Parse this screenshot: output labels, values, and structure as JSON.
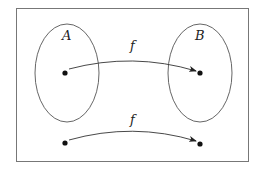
{
  "diagram": {
    "sets": [
      {
        "name": "A",
        "label": "A"
      },
      {
        "name": "B",
        "label": "B"
      }
    ],
    "arrows": [
      {
        "label": "f",
        "from": "point in A",
        "to": "point in B"
      },
      {
        "label": "f",
        "from": "point",
        "to": "point"
      }
    ],
    "colors": {
      "stroke": "#555555",
      "frame": "#777777",
      "dot": "#111111",
      "text": "#222222"
    }
  }
}
